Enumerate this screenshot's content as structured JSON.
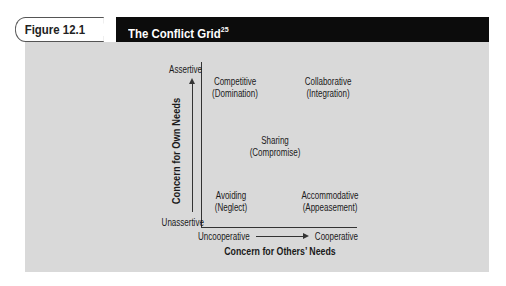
{
  "figure": {
    "label": "Figure 12.1",
    "title": "The Conflict Grid",
    "title_superscript": "25"
  },
  "diagram": {
    "y_axis": {
      "title": "Concern for Own Needs",
      "top_label": "Assertive",
      "bottom_label": "Unassertive"
    },
    "x_axis": {
      "title": "Concern for Others’ Needs",
      "left_label": "Uncooperative",
      "right_label": "Cooperative"
    },
    "styles": [
      {
        "name": "Competitive",
        "alt": "(Domination)",
        "position": "top-left"
      },
      {
        "name": "Collaborative",
        "alt": "(Integration)",
        "position": "top-right"
      },
      {
        "name": "Sharing",
        "alt": "(Compromise)",
        "position": "center"
      },
      {
        "name": "Avoiding",
        "alt": "(Neglect)",
        "position": "bottom-left"
      },
      {
        "name": "Accommodative",
        "alt": "(Appeasement)",
        "position": "bottom-right"
      }
    ]
  },
  "colors": {
    "panel_bg": "#d9d9d9",
    "title_bar_bg": "#0c0c0c",
    "text": "#1a1a1a"
  }
}
